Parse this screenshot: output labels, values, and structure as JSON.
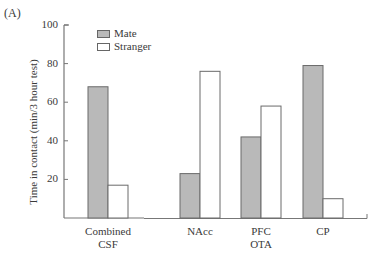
{
  "panel_label": "(A)",
  "colors": {
    "mate": "#b9b9b9",
    "stranger": "#ffffff",
    "stroke": "#6a6a6a"
  },
  "chart_data": {
    "type": "bar",
    "title": "",
    "panel": "(A)",
    "xlabel": "",
    "ylabel": "Time in contact (min/3 hour test)",
    "ylim": [
      0,
      100
    ],
    "yticks": [
      20,
      40,
      60,
      80,
      100
    ],
    "grid": false,
    "legend_position": "top-left inside",
    "categories": [
      "Combined CSF",
      "NAcc",
      "PFC OTA",
      "CP"
    ],
    "category_lines": [
      [
        "Combined",
        "CSF"
      ],
      [
        "NAcc",
        ""
      ],
      [
        "PFC",
        "OTA"
      ],
      [
        "CP",
        ""
      ]
    ],
    "series": [
      {
        "name": "Mate",
        "values": [
          68,
          23,
          42,
          79
        ]
      },
      {
        "name": "Stranger",
        "values": [
          17,
          76,
          58,
          10
        ]
      }
    ],
    "annotations": [
      "x-axis break between Combined CSF and NAcc"
    ]
  },
  "legend": {
    "items": [
      {
        "label": "Mate"
      },
      {
        "label": "Stranger"
      }
    ]
  },
  "ytick_labels": [
    "20",
    "40",
    "60",
    "80",
    "100"
  ]
}
